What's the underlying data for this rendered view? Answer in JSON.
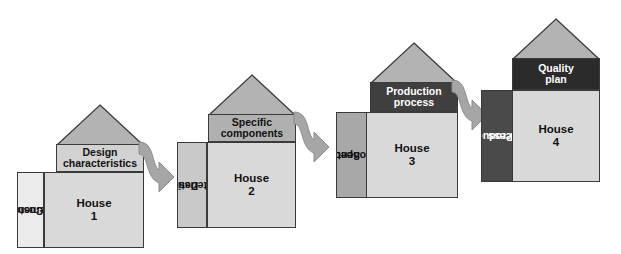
{
  "diagram": {
    "palette": {
      "roof": "#b3b3b3",
      "body": "#d9d9d9",
      "outline": "#3a3a3a",
      "arrow": "#a6a6a6",
      "arrow_outline": "#8c8c8c",
      "band_light": "#d2d2d2",
      "band_medium": "#b0b0b0",
      "band_dark": "#3f3f3f",
      "band_darkest": "#2b2b2b",
      "sidebar_lightest": "#ebebeb",
      "sidebar_light": "#c9c9c9",
      "sidebar_medium": "#a8a8a8",
      "sidebar_dark": "#4a4a4a",
      "text_dark": "#111111",
      "text_light": "#ffffff"
    },
    "houses": [
      {
        "id": "house-1",
        "body_label": "House\n1",
        "body_line1": "House",
        "body_line2": "1",
        "header_label": "Design characteristics",
        "header_line1": "Design",
        "header_line2": "characteristics",
        "sidebar_label": "Customer requirements",
        "sidebar_line1": "Customer",
        "sidebar_line2": "requirements"
      },
      {
        "id": "house-2",
        "body_label": "House\n2",
        "body_line1": "House",
        "body_line2": "2",
        "header_label": "Specific components",
        "header_line1": "Specific",
        "header_line2": "components",
        "sidebar_label": "Design characteristics",
        "sidebar_line1": "Design",
        "sidebar_line2": "characteristics"
      },
      {
        "id": "house-3",
        "body_label": "House\n3",
        "body_line1": "House",
        "body_line2": "3",
        "header_label": "Production process",
        "header_line1": "Production",
        "header_line2": "process",
        "sidebar_label": "Specific components",
        "sidebar_line1": "Specific",
        "sidebar_line2": "components"
      },
      {
        "id": "house-4",
        "body_label": "House\n4",
        "body_line1": "House",
        "body_line2": "4",
        "header_label": "Quality plan",
        "header_line1": "Quality",
        "header_line2": "plan",
        "sidebar_label": "Production process",
        "sidebar_line1": "Production",
        "sidebar_line2": "process"
      }
    ],
    "arrows": [
      {
        "id": "arrow-1-to-2",
        "from": "house-1",
        "to": "house-2"
      },
      {
        "id": "arrow-2-to-3",
        "from": "house-2",
        "to": "house-3"
      },
      {
        "id": "arrow-3-to-4",
        "from": "house-3",
        "to": "house-4"
      }
    ]
  }
}
